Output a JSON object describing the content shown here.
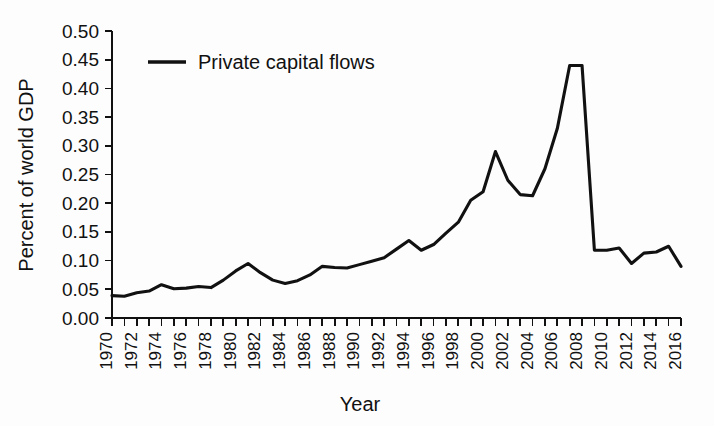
{
  "chart_data": {
    "type": "line",
    "title": "",
    "xlabel": "Year",
    "ylabel": "Percent of world GDP",
    "xlim": [
      1970,
      2016
    ],
    "ylim": [
      0.0,
      0.5
    ],
    "grid": false,
    "legend_position": "top-left",
    "series": [
      {
        "name": "Private capital flows",
        "color": "#111111",
        "x": [
          1970,
          1971,
          1972,
          1973,
          1974,
          1975,
          1976,
          1977,
          1978,
          1979,
          1980,
          1981,
          1982,
          1983,
          1984,
          1985,
          1986,
          1987,
          1988,
          1989,
          1990,
          1991,
          1992,
          1993,
          1994,
          1995,
          1996,
          1997,
          1998,
          1999,
          2000,
          2001,
          2002,
          2003,
          2004,
          2005,
          2006,
          2007,
          2008,
          2009,
          2010,
          2011,
          2012,
          2013,
          2014,
          2015,
          2016
        ],
        "values": [
          0.039,
          0.038,
          0.044,
          0.047,
          0.058,
          0.051,
          0.052,
          0.055,
          0.053,
          0.066,
          0.082,
          0.095,
          0.079,
          0.066,
          0.06,
          0.065,
          0.075,
          0.09,
          0.088,
          0.087,
          0.093,
          0.099,
          0.105,
          0.12,
          0.135,
          0.118,
          0.128,
          0.148,
          0.167,
          0.205,
          0.22,
          0.29,
          0.24,
          0.215,
          0.213,
          0.26,
          0.33,
          0.44,
          0.44,
          0.118,
          0.118,
          0.122,
          0.095,
          0.113,
          0.115,
          0.125,
          0.09
        ]
      }
    ],
    "y_ticks": [
      "0.00",
      "0.05",
      "0.10",
      "0.15",
      "0.20",
      "0.25",
      "0.30",
      "0.35",
      "0.40",
      "0.45",
      "0.50"
    ],
    "y_tick_values": [
      0.0,
      0.05,
      0.1,
      0.15,
      0.2,
      0.25,
      0.3,
      0.35,
      0.4,
      0.45,
      0.5
    ],
    "x_ticks": [
      "1970",
      "1972",
      "1974",
      "1976",
      "1978",
      "1980",
      "1982",
      "1984",
      "1986",
      "1988",
      "1990",
      "1992",
      "1994",
      "1996",
      "1998",
      "2000",
      "2002",
      "2004",
      "2006",
      "2008",
      "2010",
      "2012",
      "2014",
      "2016"
    ],
    "x_tick_values": [
      1970,
      1972,
      1974,
      1976,
      1978,
      1980,
      1982,
      1984,
      1986,
      1988,
      1990,
      1992,
      1994,
      1996,
      1998,
      2000,
      2002,
      2004,
      2006,
      2008,
      2010,
      2012,
      2014,
      2016
    ]
  },
  "legend": {
    "entries": [
      {
        "label": "Private capital flows",
        "color": "#111111"
      }
    ]
  },
  "axes": {
    "y_title": "Percent of world GDP",
    "x_title": "Year"
  }
}
